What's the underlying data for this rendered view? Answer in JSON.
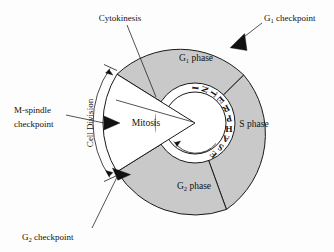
{
  "figure": {
    "background_color": "#fdfdfd",
    "sector_fill_color": "#c9c9c9",
    "mitosis_fill_color": "#ffffff",
    "line_color": "#1a1a1a",
    "marker_color": "#111111"
  },
  "geometry": {
    "center_x": 195,
    "center_y": 123,
    "outer_radius": 92,
    "annulus_outer_radius": 40,
    "annulus_inner_radius": 31
  },
  "phases": [
    {
      "id": "g1",
      "label_main": "G",
      "label_sub": "1",
      "label_tail": " phase",
      "full_label": "G1 phase",
      "label_x": 196,
      "label_y": 61,
      "fill": "#c9c9c9",
      "start_angle_deg": 148,
      "end_angle_deg": 58
    },
    {
      "id": "s",
      "label_main": "S phase",
      "label_sub": "",
      "label_tail": "",
      "full_label": "S phase",
      "label_x": 254,
      "label_y": 127,
      "fill": "#c9c9c9",
      "start_angle_deg": 58,
      "end_angle_deg": -70
    },
    {
      "id": "g2",
      "label_main": "G",
      "label_sub": "2",
      "label_tail": " phase",
      "full_label": "G2 phase",
      "label_x": 194,
      "label_y": 189,
      "fill": "#c9c9c9",
      "start_angle_deg": -70,
      "end_angle_deg": -148
    },
    {
      "id": "mitosis",
      "label_main": "Mitosis",
      "label_sub": "",
      "label_tail": "",
      "full_label": "Mitosis",
      "label_x": 146,
      "label_y": 126,
      "fill": "#ffffff",
      "start_angle_deg": 148,
      "end_angle_deg": -148
    }
  ],
  "interphase": {
    "text": "INTERPHASE",
    "letters": [
      "I",
      "N",
      "T",
      "E",
      "R",
      "P",
      "H",
      "A",
      "S",
      "E"
    ],
    "arrow_direction": "counterclockwise"
  },
  "callouts": [
    {
      "id": "cytokinesis",
      "lines": [
        "Cytokinesis"
      ],
      "text_x": 120,
      "text_y": 20,
      "anchor": "middle",
      "has_marker": false
    },
    {
      "id": "g1-checkpoint",
      "lines": [
        "G1 checkpoint"
      ],
      "label_main": "G",
      "label_sub": "1",
      "label_tail": " checkpoint",
      "text_x": 264,
      "text_y": 20,
      "anchor": "start",
      "has_marker": true,
      "marker_type": "triangle"
    },
    {
      "id": "m-spindle-checkpoint",
      "lines": [
        "M-spindle",
        "checkpoint"
      ],
      "text_x": 14,
      "text_y": 117,
      "anchor": "start",
      "has_marker": true,
      "marker_type": "triangle"
    },
    {
      "id": "g2-checkpoint",
      "lines": [
        "G2 checkpoint"
      ],
      "label_main": "G",
      "label_sub": "2",
      "label_tail": " checkpoint",
      "text_x": 22,
      "text_y": 238,
      "anchor": "start",
      "has_marker": true,
      "marker_type": "triangle"
    },
    {
      "id": "cell-division",
      "lines": [
        "Cell Division"
      ],
      "text_x": 0,
      "text_y": 0,
      "anchor": "middle",
      "has_marker": false,
      "orientation": "rotated-arc"
    }
  ],
  "checkpoint_markers": [
    {
      "id": "g1-checkpoint-marker",
      "x": 236,
      "y": 46,
      "rotation_deg": 236
    },
    {
      "id": "m-spindle-checkpoint-marker",
      "x": 113,
      "y": 123,
      "rotation_deg": 0
    },
    {
      "id": "g2-checkpoint-marker",
      "x": 122,
      "y": 172,
      "rotation_deg": 310
    }
  ]
}
